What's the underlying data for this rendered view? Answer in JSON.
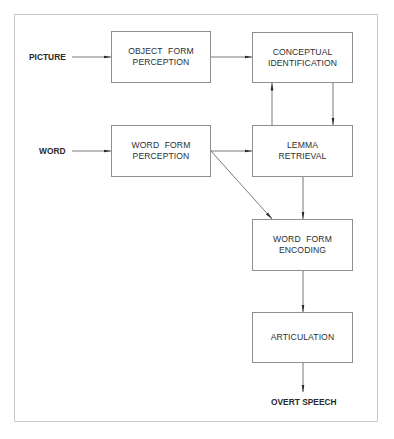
{
  "diagram": {
    "inputs": {
      "picture": "PICTURE",
      "word": "WORD"
    },
    "output": "OVERT SPEECH",
    "boxes": {
      "object_form_perception": "OBJECT FORM\nPERCEPTION",
      "conceptual_identification": "CONCEPTUAL\nIDENTIFICATION",
      "word_form_perception": "WORD FORM\nPERCEPTION",
      "lemma_retrieval": "LEMMA\nRETRIEVAL",
      "word_form_encoding": "WORD FORM\nENCODING",
      "articulation": "ARTICULATION"
    },
    "edges": [
      {
        "from": "PICTURE",
        "to": "OBJECT FORM PERCEPTION"
      },
      {
        "from": "OBJECT FORM PERCEPTION",
        "to": "CONCEPTUAL IDENTIFICATION"
      },
      {
        "from": "LEMMA RETRIEVAL",
        "to": "CONCEPTUAL IDENTIFICATION"
      },
      {
        "from": "CONCEPTUAL IDENTIFICATION",
        "to": "LEMMA RETRIEVAL"
      },
      {
        "from": "WORD",
        "to": "WORD FORM PERCEPTION"
      },
      {
        "from": "WORD FORM PERCEPTION",
        "to": "LEMMA RETRIEVAL"
      },
      {
        "from": "WORD FORM PERCEPTION",
        "to": "WORD FORM ENCODING"
      },
      {
        "from": "LEMMA RETRIEVAL",
        "to": "WORD FORM ENCODING"
      },
      {
        "from": "WORD FORM ENCODING",
        "to": "ARTICULATION"
      },
      {
        "from": "ARTICULATION",
        "to": "OVERT SPEECH"
      }
    ],
    "colors": {
      "line": "#6a6a6a",
      "box_border": "#8f8f8f",
      "frame": "#c9c9c9",
      "text": "#2e2e2e"
    }
  }
}
